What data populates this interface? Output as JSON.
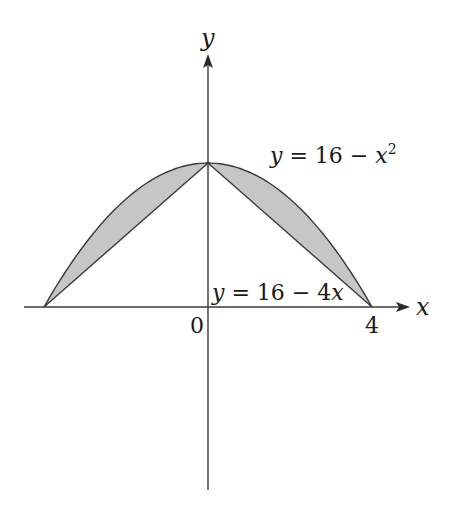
{
  "diagram": {
    "axes": {
      "x_label": "x",
      "y_label": "y",
      "origin_label": "0",
      "x_tick_label": "4"
    },
    "curves": [
      {
        "name": "parabola",
        "label": "y = 16 − x²",
        "label_main": "y = 16 − x",
        "label_sup": "2",
        "equation": "y = 16 - x^2"
      },
      {
        "name": "line",
        "label": "y = 16 − 4x",
        "equation": "y = 16 - 4x"
      }
    ],
    "points": {
      "peak": [
        0,
        16
      ],
      "right_intercept": [
        4,
        0
      ],
      "left_intercept": [
        -4,
        0
      ]
    },
    "shaded_regions": [
      "between y=16-x^2 and y=16+4x for -4<=x<=0",
      "between y=16-x^2 and y=16-4x for 0<=x<=4"
    ],
    "colors": {
      "stroke": "#3a3a3a",
      "fill": "#c6c6c6",
      "text": "#1a1a1a"
    }
  }
}
